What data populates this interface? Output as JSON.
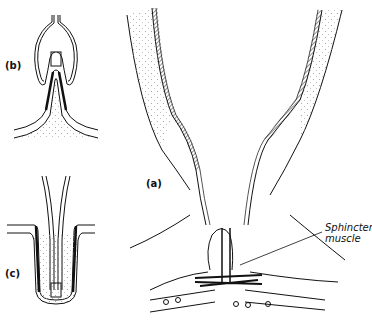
{
  "diagram": {
    "panels": [
      {
        "id": "a",
        "label": "(a)",
        "description": "Main sectional view of duct with sphincter muscle at base"
      },
      {
        "id": "b",
        "label": "(b)",
        "description": "Papilla projecting into cup-shaped opening"
      },
      {
        "id": "c",
        "label": "(c)",
        "description": "Tube inserted into invaginated pocket"
      }
    ],
    "annotations": [
      {
        "id": "sphincter",
        "lines": [
          "Sphincter",
          "muscle"
        ]
      }
    ],
    "colors": {
      "ink": "#111111",
      "stipple": "#9a9a9a",
      "background": "#ffffff"
    }
  }
}
